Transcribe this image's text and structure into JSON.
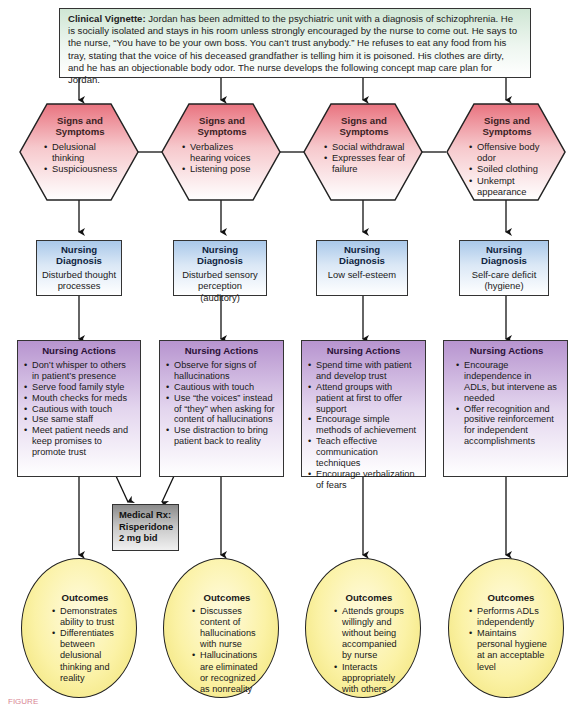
{
  "vignette": {
    "label": "Clinical Vignette:",
    "text": " Jordan has been admitted to the psychiatric unit with a diagnosis of schizophrenia. He is socially isolated and stays in his room unless strongly encouraged by the nurse to come out. He says to the nurse, “You have to be your own boss. You can’t trust anybody.” He refuses to eat any food from his tray, stating that the voice of his deceased grandfather is telling him it is poisoned. His clothes are dirty, and he has an objectionable body odor. The nurse develops the following concept map care plan for Jordan."
  },
  "columns": [
    {
      "signs": {
        "title": "Signs and Symptoms",
        "items": [
          "Delusional thinking",
          "Suspiciousness"
        ]
      },
      "diagnosis": {
        "title": "Nursing Diagnosis",
        "text": "Disturbed thought processes"
      },
      "actions": {
        "title": "Nursing Actions",
        "items": [
          "Don’t whisper to others in patient’s presence",
          "Serve food family style",
          "Mouth checks for meds",
          "Cautious with touch",
          "Use same staff",
          "Meet patient needs and keep promises to promote trust"
        ]
      },
      "outcomes": {
        "title": "Outcomes",
        "items": [
          "Demonstrates ability to trust",
          "Differentiates between delusional thinking and reality"
        ]
      }
    },
    {
      "signs": {
        "title": "Signs and Symptoms",
        "items": [
          "Verbalizes hearing voices",
          "Listening pose"
        ]
      },
      "diagnosis": {
        "title": "Nursing Diagnosis",
        "text": "Disturbed sensory perception (auditory)"
      },
      "actions": {
        "title": "Nursing Actions",
        "items": [
          "Observe for signs of hallucinations",
          "Cautious with touch",
          "Use “the voices” instead of “they” when asking for content of hallucinations",
          "Use distraction to bring patient back to reality"
        ]
      },
      "outcomes": {
        "title": "Outcomes",
        "items": [
          "Discusses content of hallucinations with nurse",
          "Hallucinations are eliminated or recognized as nonreality"
        ]
      }
    },
    {
      "signs": {
        "title": "Signs and Symptoms",
        "items": [
          "Social withdrawal",
          "Expresses fear of failure"
        ]
      },
      "diagnosis": {
        "title": "Nursing Diagnosis",
        "text": "Low self-esteem"
      },
      "actions": {
        "title": "Nursing Actions",
        "items": [
          "Spend time with patient and develop trust",
          "Attend groups with patient at first to offer support",
          "Encourage simple methods of achievement",
          "Teach effective communication techniques",
          "Encourage verbalization of fears"
        ]
      },
      "outcomes": {
        "title": "Outcomes",
        "items": [
          "Attends groups willingly and without being accompanied by nurse",
          "Interacts appropriately with others"
        ]
      }
    },
    {
      "signs": {
        "title": "Signs and Symptoms",
        "items": [
          "Offensive body odor",
          "Soiled clothing",
          "Unkempt appearance"
        ]
      },
      "diagnosis": {
        "title": "Nursing Diagnosis",
        "text": "Self-care deficit (hygiene)"
      },
      "actions": {
        "title": "Nursing Actions",
        "items": [
          "Encourage independence in ADLs, but intervene as needed",
          "Offer recognition and positive reinforcement for independent accomplishments"
        ]
      },
      "outcomes": {
        "title": "Outcomes",
        "items": [
          "Performs ADLs independently",
          "Maintains personal hygiene at an acceptable level"
        ]
      }
    }
  ],
  "medical_rx": {
    "lines": [
      "Medical Rx:",
      "Risperidone",
      "2 mg bid"
    ]
  },
  "caption": "FIGURE",
  "colors": {
    "vignette_fill": "#cfe6d4",
    "signs_fill": "#e9737f",
    "diagnosis_fill": "#a9c8ea",
    "actions_fill": "#b794cf",
    "rx_fill": "#8a8a8a",
    "outcomes_fill": "#fbf2a6"
  }
}
